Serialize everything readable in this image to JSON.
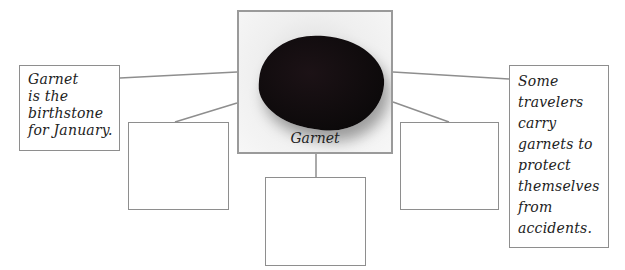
{
  "center": {
    "caption": "Garnet",
    "image": "garnet-stone-photo"
  },
  "boxes": {
    "top_left": {
      "text": "Garnet\nis the\nbirthstone\nfor January."
    },
    "mid_left": {
      "text": ""
    },
    "bottom_center": {
      "text": ""
    },
    "mid_right": {
      "text": ""
    },
    "top_right": {
      "text": "Some\ntravelers\ncarry\ngarnets to\nprotect\nthemselves\nfrom\naccidents."
    }
  },
  "colors": {
    "border": "#8e8e8e",
    "line": "#8e8e8e",
    "stone": "#0d0a0b"
  }
}
